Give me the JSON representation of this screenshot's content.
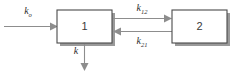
{
  "diagram": {
    "type": "two-compartment-model",
    "compartments": [
      {
        "id": "c1",
        "label": "1"
      },
      {
        "id": "c2",
        "label": "2"
      }
    ],
    "rates": {
      "input": {
        "base": "k",
        "sub": "o"
      },
      "one_to_two": {
        "base": "k",
        "sub": "12"
      },
      "two_to_one": {
        "base": "k",
        "sub": "21"
      },
      "elimination": {
        "base": "k",
        "sub": ""
      }
    },
    "colors": {
      "box_stroke": "#4a4a4a",
      "box_fill": "#ffffff",
      "box_shadow": "#9a9a9a",
      "arrow": "#8d8d8d",
      "label_text": "#3a3a3a",
      "background": "#ffffff"
    }
  }
}
